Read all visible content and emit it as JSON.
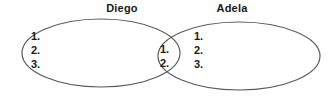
{
  "diagram": {
    "type": "venn",
    "sets": [
      {
        "name": "diego",
        "label": "Diego",
        "items": [
          "1.",
          "2.",
          "3."
        ]
      },
      {
        "name": "adela",
        "label": "Adela",
        "items": [
          "1.",
          "2.",
          "3."
        ]
      }
    ],
    "intersection": {
      "name": "diego-adela-intersection",
      "items": [
        "1.",
        "2."
      ]
    },
    "colors": {
      "stroke": "#5a5a5a",
      "text": "#1a1a1a",
      "background": "#ffffff"
    }
  }
}
